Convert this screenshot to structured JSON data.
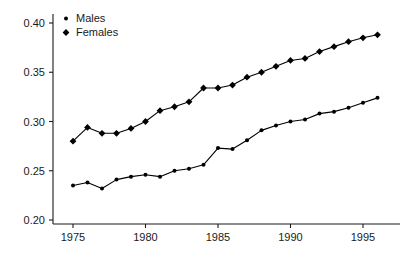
{
  "chart_data": {
    "type": "line",
    "title": "",
    "subtitle": "",
    "xlabel": "",
    "ylabel": "",
    "xlim": [
      1974.4,
      1996.8
    ],
    "ylim": [
      0.195,
      0.405
    ],
    "xticks": [
      1975,
      1980,
      1985,
      1990,
      1995
    ],
    "xtick_labels": [
      "1975",
      "1980",
      "1985",
      "1990",
      "1995"
    ],
    "yticks": [
      0.2,
      0.25,
      0.3,
      0.35,
      0.4
    ],
    "ytick_labels": [
      "0.20",
      "0.25",
      "0.30",
      "0.35",
      "0.40"
    ],
    "grid": false,
    "legend_position": "top-left",
    "x": [
      1975,
      1976,
      1977,
      1978,
      1979,
      1980,
      1981,
      1982,
      1983,
      1984,
      1985,
      1986,
      1987,
      1988,
      1989,
      1990,
      1991,
      1992,
      1993,
      1994,
      1995,
      1996
    ],
    "series": [
      {
        "name": "Males",
        "marker": "circle",
        "color": "#000000",
        "values": [
          0.235,
          0.238,
          0.232,
          0.241,
          0.244,
          0.246,
          0.244,
          0.25,
          0.252,
          0.256,
          0.273,
          0.272,
          0.281,
          0.291,
          0.296,
          0.3,
          0.302,
          0.308,
          0.31,
          0.314,
          0.319,
          0.324
        ]
      },
      {
        "name": "Females",
        "marker": "diamond",
        "color": "#000000",
        "values": [
          0.28,
          0.294,
          0.288,
          0.288,
          0.293,
          0.3,
          0.311,
          0.315,
          0.32,
          0.334,
          0.334,
          0.337,
          0.345,
          0.35,
          0.356,
          0.362,
          0.364,
          0.371,
          0.376,
          0.381,
          0.385,
          0.388
        ]
      }
    ]
  },
  "legend": {
    "items": [
      {
        "label": "Males",
        "marker": "circle"
      },
      {
        "label": "Females",
        "marker": "diamond"
      }
    ]
  },
  "axes": {
    "x_axis_name": "year-axis",
    "y_axis_name": "value-axis"
  },
  "colors": {
    "ink": "#1a1a1a",
    "series": "#000000",
    "background": "#ffffff"
  }
}
